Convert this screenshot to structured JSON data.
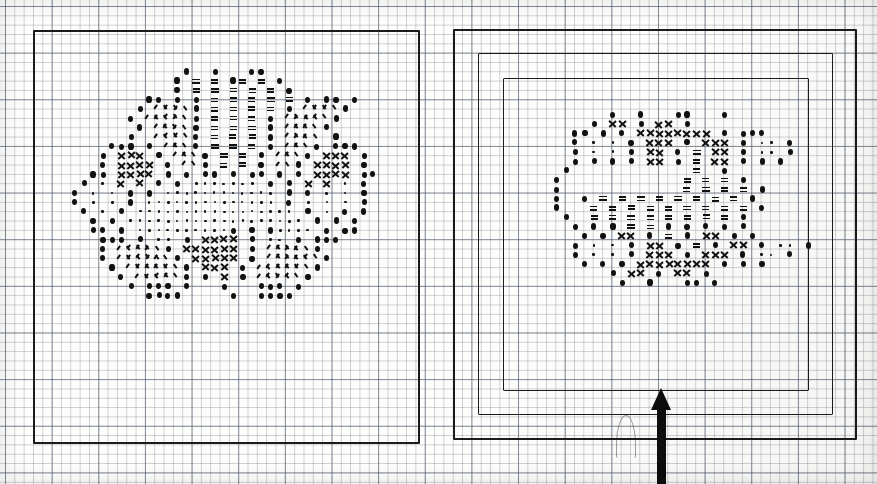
{
  "document": {
    "kind": "cross-stitch-chart-sheet",
    "title": "Cross-stitch pattern charts",
    "panel_count": 2,
    "background_color": "#fdfdfb",
    "ink_color": "#111111",
    "grid": {
      "cell_px": 9.33,
      "minor_color": "#5a6478",
      "major_color": "#3c465a",
      "major_every": 5,
      "origin_x": 5,
      "origin_y": 6
    }
  },
  "symbol_key": [
    {
      "code": "dot",
      "name": "filled-dot-stitch",
      "glyph": "●"
    },
    {
      "code": "sdot",
      "name": "small-dot-stitch",
      "glyph": "·"
    },
    {
      "code": "eq",
      "name": "double-bar-stitch",
      "glyph": "≡"
    },
    {
      "code": "car",
      "name": "caret-stitch",
      "glyph": "∧"
    },
    {
      "code": "x",
      "name": "cross-stitch",
      "glyph": "✕"
    },
    {
      "code": "sl",
      "name": "slash-stitch",
      "glyph": "/"
    }
  ],
  "panels": [
    {
      "id": "left-panel",
      "name": "left-chart-panel",
      "label": "Left chart",
      "frames": [
        {
          "name": "outer-frame",
          "x": 33,
          "y": 30,
          "w": 387,
          "h": 414
        }
      ],
      "motif": {
        "name": "left-floral-motif",
        "origin_x": 70,
        "origin_y": 67,
        "cell": 9.33,
        "rows": [
          "............o..o...oo...........",
          "...........o.e.e.oe.e.o.........",
          "...........o.e.e.e.e.e.o........",
          "........oo.o.o.e.e.e.e.e.o.oo.o.",
          ".......o.aaa.o.e.e.e.e.o.aaa.o..",
          "......o.aaaa.o.e.e.e.o.aaaa.o...",
          ".......o.aaa.o.e.e.e.o.aaa.o....",
          "......o..aaa.o.e.e.e.o.aaa..o...",
          "....ooo.o.aa.o.e.e.e.o.aa.o.ooo.",
          "...o.xxx.o.aa.o.e.e.o.aa.o.xxx.o",
          "...o.xxxx.o.a.o.e.e.o.a.o.xxxx.o",
          "..oo.xxxx.o.o.oo.o.oo.o.o.xxxx.oo",
          ".o.s.x.x.o.o.sssssss.o.o.x.x.s.o",
          "o.s.s.o.o.ssssssssssss.o.o.s.s.o",
          "o.s.s.o.ssssssssssssss.o.s.s.s.o",
          ".o.s.o.sssssssssssssssss.o.s.o.o",
          "..o.o.sssssssssssssssssss.o.o.o.",
          "..oo.o.sssssssssso.o.ossss.o.oo.",
          "...ooo.o.ss.o.xxxx.o.ss.o.ooo...",
          "...o.aaaa.o.xxxxxx.o.aaaa.o.....",
          "...o.aaaaa.o.xxxxx.o.aaaaa.o....",
          "....o.aaaaa.o.xxx.o.aaaaa.o.....",
          ".....o.aaaa.o.o.x.o.aaaa.o......",
          "......o.ooo.o...o...ooo.o.......",
          "........oooo.....o..oooo........"
        ]
      }
    },
    {
      "id": "right-panel",
      "name": "right-chart-panel",
      "label": "Right chart",
      "frames": [
        {
          "name": "outer-frame",
          "x": 453,
          "y": 29,
          "w": 404,
          "h": 411
        },
        {
          "name": "middle-frame",
          "x": 478,
          "y": 53,
          "w": 355,
          "h": 362
        },
        {
          "name": "inner-frame",
          "x": 503,
          "y": 78,
          "w": 306,
          "h": 313
        }
      ],
      "motif": {
        "name": "right-floral-motif",
        "origin_x": 552,
        "origin_y": 110,
        "cell": 9.33,
        "rows": [
          "......o..o...oo...o.....",
          "....o.xx.o.xx.o........",
          "..oo.o.o.xxxxxxxx.o.ooo.",
          "..o.s.s.o.xxx.o.xxx.o.ss.o",
          "..o.s.s.o.xx.o.e.xx.o.ss.o",
          "..o.o.o.o.xx.o.e.xx.o.o.o.",
          ".o.............e..o......",
          "o.............e.e.e.o....",
          "o.............e.e.e.e.o..",
          "o..o.e.e.e.e.e.e.e.e.o...",
          "o...e.e.e.e.e.e.e.e.e.o..",
          ".o..e.e.e.e.e.e.e.e.o....",
          "..o.o.o.e.e.o.o.o.o.o....",
          "...o.o.xx.o.e.o.xx.o.o...",
          "..o.s.s.o.xx.o.e.o.xx.o.ss.o",
          "..o.s.s.o.xxx.o.xxx.o.ss.o",
          "...o.o.o.xxxxxxxx.o.o.o..",
          "......o.xx.o.xx.o........",
          ".......o..o...oo.o......."
        ]
      }
    }
  ],
  "annotations": {
    "arrow": {
      "name": "up-arrow-pointer",
      "description": "Bold black arrow pointing up at the bottom border of the right chart",
      "tip_x": 661,
      "tip_y": 388,
      "tail_y": 484,
      "color": "#0d0d0d"
    },
    "ghost_mark": {
      "name": "faint-pencil-mark",
      "x": 616,
      "y": 415,
      "w": 18,
      "h": 42
    }
  }
}
